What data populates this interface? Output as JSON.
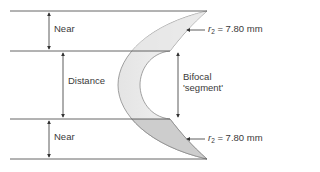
{
  "diagram": {
    "zones": {
      "near_top": "Near",
      "distance": "Distance",
      "near_bottom": "Near"
    },
    "segment_label_line1": "Bifocal",
    "segment_label_line2": "'segment'",
    "radius_top": {
      "symbol": "r",
      "subscript": "2",
      "value": " = 7.80 mm"
    },
    "radius_bottom": {
      "symbol": "r",
      "subscript": "2",
      "value": " = 7.80 mm"
    },
    "colors": {
      "line": "#555555",
      "lens_stroke": "#8a8a8a",
      "lens_fill_light": "#f0f0f0",
      "lens_fill_dark": "#cfcfcf",
      "text": "#3a3a3a"
    }
  }
}
